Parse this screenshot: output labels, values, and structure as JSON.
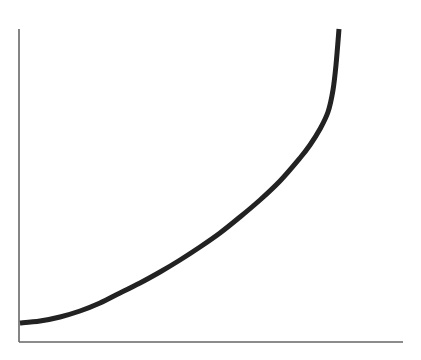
{
  "chart_data": {
    "type": "line",
    "title": "",
    "xlabel": "",
    "ylabel": "",
    "grid": false,
    "legend": [],
    "x_ticks": [],
    "y_ticks": [],
    "series": [
      {
        "name": "curve",
        "color": "#222222",
        "points_px": [
          [
            20,
            323
          ],
          [
            40,
            321
          ],
          [
            60,
            317
          ],
          [
            80,
            311
          ],
          [
            100,
            303
          ],
          [
            120,
            293
          ],
          [
            140,
            283
          ],
          [
            160,
            272
          ],
          [
            180,
            260
          ],
          [
            200,
            247
          ],
          [
            220,
            233
          ],
          [
            240,
            217
          ],
          [
            260,
            200
          ],
          [
            280,
            181
          ],
          [
            300,
            158
          ],
          [
            310,
            145
          ],
          [
            320,
            129
          ],
          [
            328,
            112
          ],
          [
            333,
            90
          ],
          [
            336,
            65
          ],
          [
            339,
            29
          ]
        ],
        "x": [
          0,
          0.0625,
          0.125,
          0.1875,
          0.25,
          0.3125,
          0.375,
          0.4375,
          0.5,
          0.5625,
          0.625,
          0.6875,
          0.75,
          0.8125,
          0.875,
          0.906,
          0.937,
          0.962,
          0.978,
          0.987,
          1.0
        ],
        "values": [
          0,
          0.007,
          0.02,
          0.04,
          0.07,
          0.1,
          0.14,
          0.17,
          0.21,
          0.26,
          0.3,
          0.36,
          0.42,
          0.48,
          0.56,
          0.6,
          0.66,
          0.72,
          0.79,
          0.88,
          1.0
        ]
      }
    ],
    "axes": {
      "color": "#666666",
      "origin_px": [
        20,
        342
      ],
      "x_end_px": [
        403,
        342
      ],
      "y_end_px": [
        20,
        29
      ]
    }
  }
}
